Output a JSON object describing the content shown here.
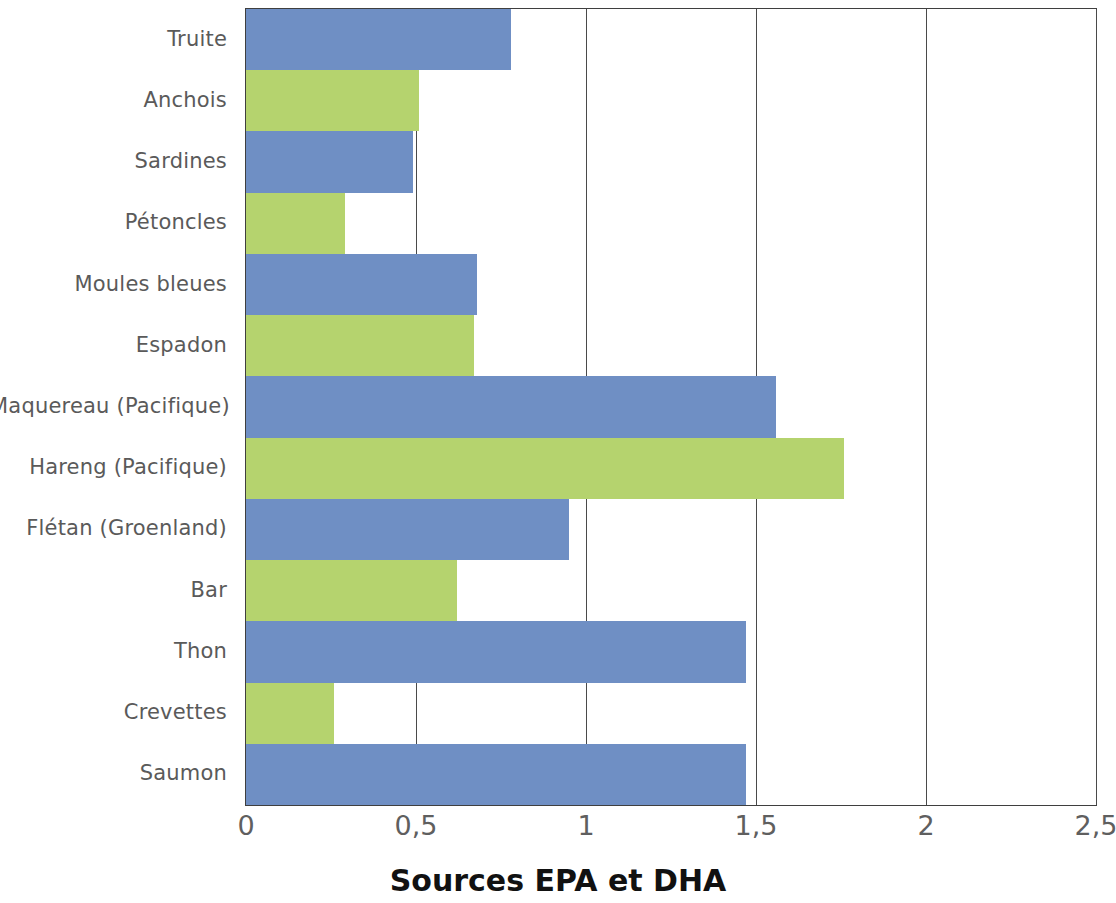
{
  "chart_data": {
    "type": "bar",
    "orientation": "horizontal",
    "title": "",
    "caption": "Sources EPA et DHA",
    "xlabel": "",
    "ylabel": "",
    "xlim": [
      0,
      2.5
    ],
    "xticks": [
      "0",
      "0,5",
      "1",
      "1,5",
      "2",
      "2,5"
    ],
    "xtick_values": [
      0,
      0.5,
      1,
      1.5,
      2,
      2.5
    ],
    "grid": "vertical",
    "legend": "none",
    "categories": [
      "Truite",
      "Anchois",
      "Sardines",
      "Pétoncles",
      "Moules bleues",
      "Espadon",
      "Maquereau (Pacifique)",
      "Hareng (Pacifique)",
      "Flétan (Groenland)",
      "Bar",
      "Thon",
      "Crevettes",
      "Saumon"
    ],
    "values": [
      0.78,
      0.51,
      0.49,
      0.29,
      0.68,
      0.67,
      1.56,
      1.76,
      0.95,
      0.62,
      1.47,
      0.26,
      1.47
    ],
    "bar_colors": [
      "#6f8fc4",
      "#b5d36e",
      "#6f8fc4",
      "#b5d36e",
      "#6f8fc4",
      "#b5d36e",
      "#6f8fc4",
      "#b5d36e",
      "#6f8fc4",
      "#b5d36e",
      "#6f8fc4",
      "#b5d36e",
      "#6f8fc4"
    ]
  },
  "colors": {
    "blue": "#6f8fc4",
    "green": "#b5d36e",
    "axis": "#3f3f3f",
    "grid": "#4a4a4a",
    "label_text": "#5a5a5a",
    "tick_text": "#5f5f5f",
    "caption_text": "#111111",
    "background": "#ffffff"
  }
}
